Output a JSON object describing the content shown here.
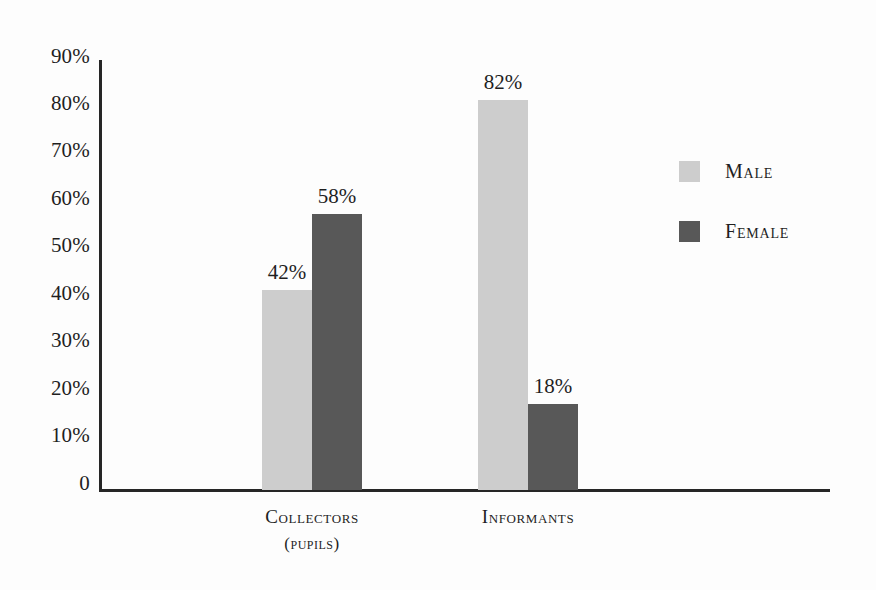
{
  "chart_data": {
    "type": "bar",
    "title": "",
    "subtitle": "",
    "xlabel": "",
    "ylabel": "",
    "ylim": [
      0,
      90
    ],
    "grid": false,
    "legend_position": "right",
    "categories": [
      "Collectors",
      "Informants"
    ],
    "category_sublabels": [
      "(pupils)",
      ""
    ],
    "ytick_labels": [
      "90%",
      "80%",
      "70%",
      "60%",
      "50%",
      "40%",
      "30%",
      "20%",
      "10%",
      "0"
    ],
    "ytick_values": [
      90,
      80,
      70,
      60,
      50,
      40,
      30,
      20,
      10,
      0
    ],
    "series": [
      {
        "name": "Male",
        "color": "#cdcdcd",
        "values": [
          42,
          82
        ],
        "value_labels": [
          "42%",
          "82%"
        ]
      },
      {
        "name": "Female",
        "color": "#585858",
        "values": [
          58,
          18
        ],
        "value_labels": [
          "58%",
          "18%"
        ]
      }
    ]
  },
  "legend": {
    "items": [
      {
        "label": "Male",
        "color": "#cdcdcd"
      },
      {
        "label": "Female",
        "color": "#585858"
      }
    ]
  },
  "colors": {
    "background": "#fdfdfd",
    "axis": "#262626",
    "text": "#1f1f1f",
    "male": "#cdcdcd",
    "female": "#585858"
  }
}
